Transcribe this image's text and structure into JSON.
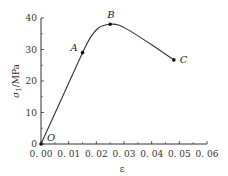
{
  "chart_data": {
    "type": "line",
    "title": "",
    "xlabel": "ε",
    "ylabel": "σ1/MPa",
    "xlim": [
      0,
      0.06
    ],
    "ylim": [
      0,
      40
    ],
    "x_ticks": [
      "0.00",
      "0.01",
      "0.02",
      "0.03",
      "0.04",
      "0.05",
      "0.06"
    ],
    "y_ticks": [
      "0",
      "10",
      "20",
      "30",
      "40"
    ],
    "grid": false,
    "series": [
      {
        "name": "stress-strain",
        "x": [
          0,
          0.015,
          0.018,
          0.021,
          0.025,
          0.028,
          0.032,
          0.04,
          0.048
        ],
        "y": [
          0,
          29,
          34,
          37,
          38,
          37.8,
          36,
          31.5,
          26.7
        ]
      }
    ],
    "annotations": [
      {
        "label": "O",
        "x": 0,
        "y": 0
      },
      {
        "label": "A",
        "x": 0.015,
        "y": 29
      },
      {
        "label": "B",
        "x": 0.025,
        "y": 38
      },
      {
        "label": "C",
        "x": 0.048,
        "y": 26.7
      }
    ]
  }
}
